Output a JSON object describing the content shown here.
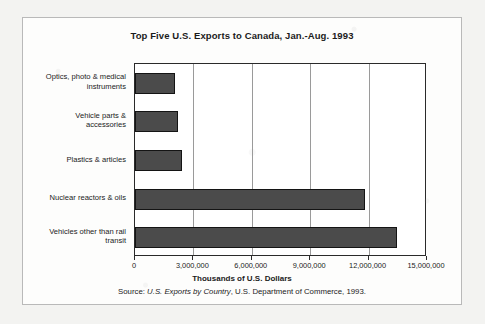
{
  "figure": {
    "title": "Top Five U.S. Exports to Canada, Jan.-Aug. 1993",
    "x_axis_title": "Thousands of U.S. Dollars",
    "source": {
      "prefix": "Source: ",
      "publication": "U.S. Exports by Country",
      "suffix": ", U.S. Department of Commerce, 1993."
    }
  },
  "chart_data": {
    "type": "bar",
    "orientation": "horizontal",
    "title": "Top Five U.S. Exports to Canada, Jan.-Aug. 1993",
    "xlabel": "Thousands of U.S. Dollars",
    "ylabel": "",
    "xlim": [
      0,
      15000000
    ],
    "grid": true,
    "legend": false,
    "bar_color": "#4b4b4b",
    "bar_edge_color": "#141414",
    "categories": [
      "Optics, photo & medical instruments",
      "Vehicle parts & accessories",
      "Plastics & articles",
      "Nuclear reactors & oils",
      "Vehicles other than rail transit"
    ],
    "category_lines": [
      [
        "Optics, photo & medical",
        "instruments"
      ],
      [
        "Vehicle parts &",
        "accessories"
      ],
      [
        "Plastics & articles"
      ],
      [
        "Nuclear reactors & oils"
      ],
      [
        "Vehicles other than rail",
        "transit"
      ]
    ],
    "values": [
      2050000,
      2200000,
      2400000,
      11800000,
      13450000
    ],
    "xticks": [
      0,
      3000000,
      6000000,
      9000000,
      12000000,
      15000000
    ],
    "xticklabels": [
      "0",
      "3,000,000",
      "6,000,000",
      "9,000,000",
      "12,000,000",
      "15,000,000"
    ]
  }
}
